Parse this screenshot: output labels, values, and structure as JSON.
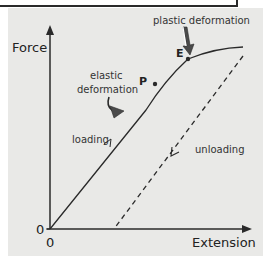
{
  "diagram": {
    "axes": {
      "y_label": "Force",
      "x_label": "Extension",
      "y_origin": "0",
      "x_origin": "0"
    },
    "points": {
      "p_label": "P",
      "e_label": "E"
    },
    "annotations": {
      "plastic": "plastic deformation",
      "elastic_line1": "elastic",
      "elastic_line2": "deformation",
      "loading": "loading",
      "unloading": "unloading"
    },
    "colors": {
      "background": "#e9e9e7",
      "ink": "#2a2a2a",
      "arrow_fill": "#4a4a4a"
    }
  }
}
